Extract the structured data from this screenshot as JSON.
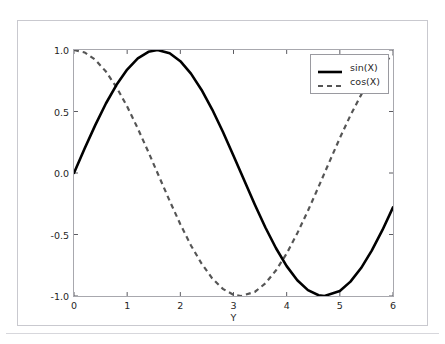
{
  "page": {
    "clipped_top_text": "· · · ·"
  },
  "chart_data": {
    "type": "line",
    "title": "",
    "xlabel": "Y",
    "ylabel": "",
    "xlim": [
      0,
      6
    ],
    "ylim": [
      -1.0,
      1.0
    ],
    "xticks": [
      0,
      1,
      2,
      3,
      4,
      5,
      6
    ],
    "xtick_labels": [
      "0",
      "1",
      "2",
      "3",
      "4",
      "5",
      "6"
    ],
    "yticks": [
      1.0,
      0.5,
      0.0,
      -0.5,
      -1.0
    ],
    "ytick_labels": [
      "1.0",
      "0.5",
      "0.0",
      "-0.5",
      "-1.0"
    ],
    "grid": false,
    "legend_position": "upper right",
    "series": [
      {
        "name": "sin(X)",
        "style": "solid",
        "color": "#000000",
        "width": 2.6,
        "x": [
          0,
          0.2,
          0.4,
          0.6,
          0.8,
          1.0,
          1.2,
          1.4,
          1.5708,
          1.8,
          2.0,
          2.2,
          2.4,
          2.6,
          2.8,
          3.0,
          3.1416,
          3.4,
          3.6,
          3.8,
          4.0,
          4.2,
          4.4,
          4.6,
          4.7124,
          5.0,
          5.2,
          5.4,
          5.6,
          5.8,
          6.0
        ],
        "values": [
          0.0,
          0.199,
          0.389,
          0.565,
          0.717,
          0.841,
          0.932,
          0.985,
          1.0,
          0.974,
          0.909,
          0.808,
          0.675,
          0.516,
          0.335,
          0.141,
          0.0,
          -0.256,
          -0.443,
          -0.612,
          -0.757,
          -0.872,
          -0.952,
          -0.994,
          -1.0,
          -0.959,
          -0.883,
          -0.773,
          -0.631,
          -0.465,
          -0.279
        ]
      },
      {
        "name": "cos(X)",
        "style": "dashed",
        "color": "#555555",
        "width": 2.2,
        "x": [
          0,
          0.2,
          0.4,
          0.6,
          0.8,
          1.0,
          1.2,
          1.4,
          1.5708,
          1.8,
          2.0,
          2.2,
          2.4,
          2.6,
          2.8,
          3.0,
          3.1416,
          3.4,
          3.6,
          3.8,
          4.0,
          4.2,
          4.4,
          4.6,
          4.7124,
          5.0,
          5.2,
          5.4,
          5.6,
          5.8,
          6.0
        ],
        "values": [
          1.0,
          0.98,
          0.921,
          0.825,
          0.697,
          0.54,
          0.362,
          0.17,
          0.0,
          -0.227,
          -0.416,
          -0.589,
          -0.737,
          -0.857,
          -0.942,
          -0.99,
          -1.0,
          -0.967,
          -0.897,
          -0.791,
          -0.654,
          -0.49,
          -0.307,
          -0.112,
          0.0,
          0.284,
          0.469,
          0.635,
          0.776,
          0.886,
          0.96
        ]
      }
    ]
  }
}
